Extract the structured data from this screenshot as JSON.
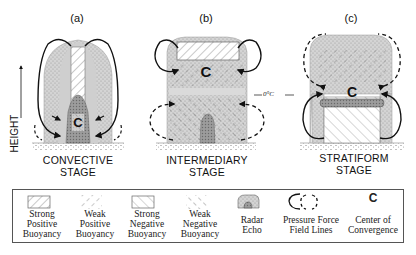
{
  "figure": {
    "axis_label": "HEIGHT",
    "freezing_level_label": "0°C",
    "panels": [
      {
        "id": "a",
        "label": "(a)",
        "stage": [
          "CONVECTIVE",
          "STAGE"
        ]
      },
      {
        "id": "b",
        "label": "(b)",
        "stage": [
          "INTERMEDIARY",
          "STAGE"
        ]
      },
      {
        "id": "c",
        "label": "(c)",
        "stage": [
          "STRATIFORM",
          "STAGE"
        ]
      }
    ],
    "center_glyph": "C"
  },
  "legend": {
    "items": [
      {
        "icon": "strong-positive-buoyancy-swatch",
        "lines": [
          "Strong",
          "Positive",
          "Buoyancy"
        ]
      },
      {
        "icon": "weak-positive-buoyancy-swatch",
        "lines": [
          "Weak",
          "Positive",
          "Buoyancy"
        ]
      },
      {
        "icon": "strong-negative-buoyancy-swatch",
        "lines": [
          "Strong",
          "Negative",
          "Buoyancy"
        ]
      },
      {
        "icon": "weak-negative-buoyancy-swatch",
        "lines": [
          "Weak",
          "Negative",
          "Buoyancy"
        ]
      },
      {
        "icon": "radar-echo-swatch",
        "lines": [
          "Radar",
          "Echo"
        ]
      },
      {
        "icon": "pressure-force-field-lines-icon",
        "lines": [
          "Pressure Force",
          "Field Lines"
        ]
      },
      {
        "icon": "center-of-convergence-icon",
        "glyph": "C",
        "lines": [
          "Center of",
          "Convergence"
        ]
      }
    ]
  },
  "colors": {
    "cloud_fill": "#d9d9d9",
    "cloud_dark": "#b3b3b3",
    "radar_echo": "#8c8c8c",
    "line": "#111111"
  }
}
